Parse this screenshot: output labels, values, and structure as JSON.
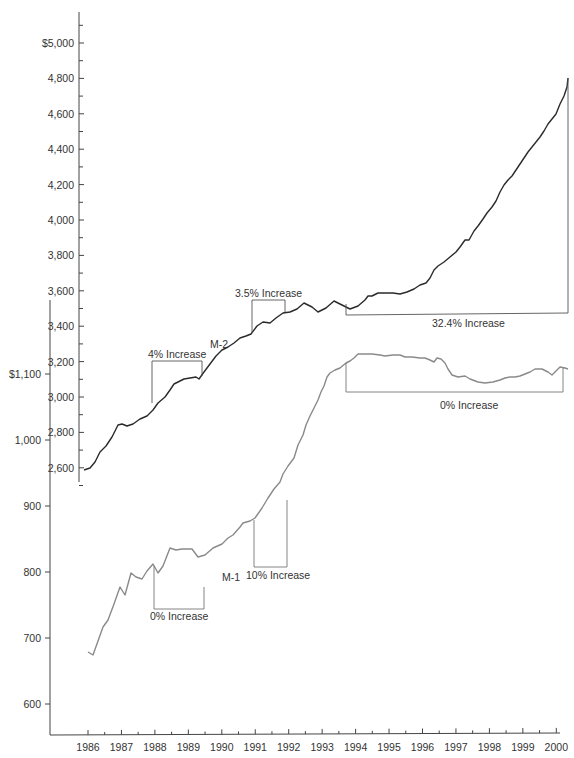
{
  "chart_data": {
    "type": "line",
    "title": "",
    "xlabel": "",
    "x": [
      1986,
      1987,
      1988,
      1989,
      1990,
      1991,
      1992,
      1993,
      1994,
      1995,
      1996,
      1997,
      1998,
      1999,
      2000
    ],
    "x_tick_labels": [
      "1986",
      "1987",
      "1988",
      "1989",
      "1990",
      "1991",
      "1992",
      "1993",
      "1994",
      "1995",
      "1996",
      "1997",
      "1998",
      "1999",
      "2000"
    ],
    "axes": [
      {
        "name": "M-2 axis",
        "ylabel": "M-2 ($ billions)",
        "ylim": [
          2580,
          5150
        ],
        "tick_labels": [
          "$5,000",
          "4,800",
          "4,600",
          "4,400",
          "4,200",
          "4,000",
          "3,800",
          "3,600",
          "3,400",
          "3,200",
          "3,000",
          "2,800",
          "2,600"
        ],
        "tick_values": [
          5000,
          4800,
          4600,
          4400,
          4200,
          4000,
          3800,
          3600,
          3400,
          3200,
          3000,
          2800,
          2600
        ]
      },
      {
        "name": "M-1 axis",
        "ylabel": "M-1 ($ billions)",
        "ylim": [
          550,
          1130
        ],
        "tick_labels": [
          "$1,100",
          "1,000",
          "900",
          "800",
          "700",
          "600"
        ],
        "tick_values": [
          1100,
          1000,
          900,
          800,
          700,
          600
        ]
      }
    ],
    "series": [
      {
        "name": "M-2",
        "axis": "M-2 axis",
        "color": "#2a2a2a",
        "x": [
          1986.0,
          1986.5,
          1987.0,
          1987.5,
          1988.0,
          1988.5,
          1989.0,
          1989.5,
          1990.0,
          1990.5,
          1991.0,
          1991.5,
          1992.0,
          1992.5,
          1993.0,
          1993.5,
          1994.0,
          1994.5,
          1995.0,
          1995.5,
          1996.0,
          1996.5,
          1997.0,
          1997.5,
          1998.0,
          1998.5,
          1999.0,
          1999.5,
          2000.0,
          2000.2
        ],
        "values": [
          2590,
          2690,
          2830,
          2870,
          2940,
          3030,
          3070,
          3080,
          3200,
          3270,
          3340,
          3380,
          3440,
          3460,
          3500,
          3480,
          3540,
          3570,
          3570,
          3590,
          3650,
          3760,
          3830,
          3900,
          4060,
          4220,
          4420,
          4560,
          4700,
          4800
        ]
      },
      {
        "name": "M-1",
        "axis": "M-1 axis",
        "color": "#8a8a8a",
        "x": [
          1986.0,
          1986.25,
          1986.5,
          1986.75,
          1987.0,
          1987.25,
          1987.5,
          1987.75,
          1988.0,
          1988.25,
          1988.5,
          1988.75,
          1989.0,
          1989.25,
          1989.5,
          1989.75,
          1990.0,
          1990.5,
          1991.0,
          1991.25,
          1991.5,
          1991.75,
          1992.0,
          1992.5,
          1993.0,
          1993.5,
          1994.0,
          1994.5,
          1995.0,
          1995.5,
          1996.0,
          1996.5,
          1997.0,
          1997.5,
          1998.0,
          1998.5,
          1999.0,
          1999.5,
          2000.0
        ],
        "values": [
          635,
          630,
          680,
          695,
          740,
          725,
          755,
          748,
          765,
          755,
          790,
          788,
          788,
          788,
          775,
          780,
          790,
          805,
          825,
          840,
          870,
          890,
          930,
          975,
          1040,
          1080,
          1120,
          1140,
          1148,
          1145,
          1135,
          1110,
          1100,
          1095,
          1102,
          1106,
          1112,
          1118,
          1118
        ]
      }
    ],
    "annotations": [
      {
        "text": "4% Increase",
        "series": "M-2",
        "from": 1988.0,
        "to": 1989.5
      },
      {
        "text": "3.5% Increase",
        "series": "M-2",
        "from": 1991.0,
        "to": 1991.9
      },
      {
        "text": "32.4% Increase",
        "series": "M-2",
        "from": 1993.7,
        "to": 2000.2
      },
      {
        "text": "0% Increase",
        "series": "M-1",
        "from": 1988.0,
        "to": 1989.5
      },
      {
        "text": "10% Increase",
        "series": "M-1",
        "from": 1991.0,
        "to": 1991.9
      },
      {
        "text": "0% Increase",
        "series": "M-1",
        "from": 1993.7,
        "to": 2000.2
      }
    ],
    "series_labels": [
      "M-2",
      "M-1"
    ],
    "grid": false,
    "legend": "inline labels"
  },
  "labels": {
    "m2_label": "M-2",
    "m1_label": "M-1",
    "annot_m2_1": "4% Increase",
    "annot_m2_2": "3.5% Increase",
    "annot_m2_3": "32.4% Increase",
    "annot_m1_1": "0% Increase",
    "annot_m1_2": "10% Increase",
    "annot_m1_3": "0% Increase"
  }
}
